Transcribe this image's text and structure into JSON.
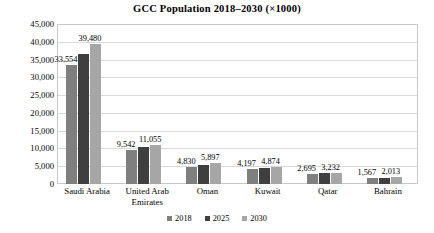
{
  "chart_data": {
    "type": "bar",
    "title": "GCC Population 2018–2030 (×1000)",
    "xlabel": "",
    "ylabel": "",
    "ylim": [
      0,
      45000
    ],
    "ytick_step": 5000,
    "yticks": [
      "0",
      "5,000",
      "10,000",
      "15,000",
      "20,000",
      "25,000",
      "30,000",
      "35,000",
      "40,000",
      "45,000"
    ],
    "grid": "horizontal",
    "legend_position": "bottom-center",
    "categories": [
      "Saudi Arabia",
      "United Arab Emirates",
      "Oman",
      "Kuwait",
      "Qatar",
      "Bahrain"
    ],
    "category_lines": [
      [
        "Saudi Arabia"
      ],
      [
        "United Arab",
        "Emirates"
      ],
      [
        "Oman"
      ],
      [
        "Kuwait"
      ],
      [
        "Qatar"
      ],
      [
        "Bahrain"
      ]
    ],
    "series": [
      {
        "name": "2018",
        "color": "#7f7f7f",
        "values": [
          33554,
          9542,
          4830,
          4197,
          2695,
          1567
        ],
        "labels": [
          "33,554",
          "9,542",
          "4,830",
          "4,197",
          "2,695",
          "1,567"
        ],
        "labels_shown": true
      },
      {
        "name": "2025",
        "color": "#3f3f3f",
        "values": [
          36500,
          10300,
          5350,
          4540,
          2960,
          1790
        ],
        "labels": [
          "",
          "",
          "",
          "",
          "",
          ""
        ],
        "labels_shown": false
      },
      {
        "name": "2030",
        "color": "#a6a6a6",
        "values": [
          39480,
          11055,
          5897,
          4874,
          3232,
          2013
        ],
        "labels": [
          "39,480",
          "11,055",
          "5,897",
          "4,874",
          "3,232",
          "2,013"
        ],
        "labels_shown": true
      }
    ]
  }
}
